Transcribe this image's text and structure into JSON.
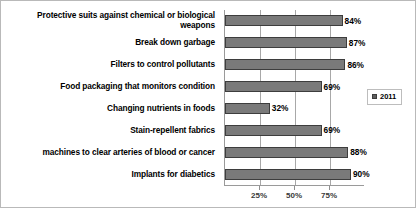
{
  "chart_data": {
    "type": "bar",
    "orientation": "horizontal",
    "title": "",
    "xlabel": "",
    "ylabel": "",
    "xlim": [
      0,
      100
    ],
    "xticks": [
      "25%",
      "50%",
      "75%"
    ],
    "xtick_values": [
      25,
      50,
      75
    ],
    "grid": true,
    "legend_position": "right",
    "categories": [
      "Protective suits against chemical or biological weapons",
      "Break down garbage",
      "Filters to control pollutants",
      "Food packaging that monitors condition",
      "Changing nutrients in foods",
      "Stain-repellent fabrics",
      "machines to clear arteries of blood or cancer",
      "Implants for diabetics"
    ],
    "values": [
      84,
      87,
      86,
      69,
      32,
      69,
      88,
      90
    ],
    "value_labels": [
      "84%",
      "87%",
      "86%",
      "69%",
      "32%",
      "69%",
      "88%",
      "90%"
    ],
    "series": [
      {
        "name": "2011",
        "values": [
          84,
          87,
          86,
          69,
          32,
          69,
          88,
          90
        ]
      }
    ]
  },
  "legend": {
    "marker": "legend-swatch-icon",
    "entries": [
      {
        "label": "2011"
      }
    ]
  },
  "colors": {
    "bar_fill": "#7a7a7a",
    "bar_border": "#3d3d3d",
    "gridline": "#a8a8a8",
    "axis": "#9a9a9a",
    "frame": "#b9b9b9",
    "text": "#000000",
    "background": "#ffffff"
  }
}
